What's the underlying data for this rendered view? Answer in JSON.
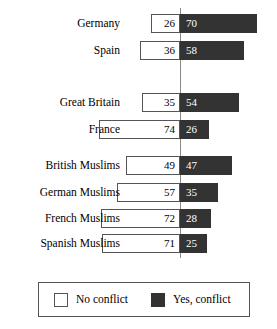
{
  "chart_data": {
    "type": "bar",
    "subtype": "diverging-stacked-bar",
    "title": "",
    "xlabel": "",
    "ylabel": "",
    "categories": [
      "Germany",
      "Spain",
      "Great Britain",
      "France",
      "British Muslims",
      "German Muslims",
      "French Muslims",
      "Spanish Muslims"
    ],
    "series": [
      {
        "name": "No conflict",
        "color": "#ffffff",
        "values": [
          26,
          36,
          35,
          74,
          49,
          57,
          72,
          71
        ]
      },
      {
        "name": "Yes, conflict",
        "color": "#333333",
        "values": [
          70,
          58,
          54,
          26,
          47,
          35,
          28,
          25
        ]
      }
    ],
    "groups": [
      {
        "name": "general-publics-a",
        "categories": [
          "Germany",
          "Spain"
        ]
      },
      {
        "name": "general-publics-b",
        "categories": [
          "Great Britain",
          "France"
        ]
      },
      {
        "name": "muslim-publics",
        "categories": [
          "British Muslims",
          "German Muslims",
          "French Muslims",
          "Spanish Muslims"
        ]
      }
    ],
    "grid": false,
    "legend_position": "bottom",
    "axis_center": 0,
    "units": "percent"
  },
  "rows": [
    {
      "label": "Germany",
      "left": 26,
      "right": 70,
      "top": 14
    },
    {
      "label": "Spain",
      "left": 36,
      "right": 58,
      "top": 41
    },
    {
      "label": "Great Britain",
      "left": 35,
      "right": 54,
      "top": 93
    },
    {
      "label": "France",
      "left": 74,
      "right": 26,
      "top": 120
    },
    {
      "label": "British Muslims",
      "left": 49,
      "right": 47,
      "top": 156
    },
    {
      "label": "German Muslims",
      "left": 57,
      "right": 35,
      "top": 183
    },
    {
      "label": "French Muslims",
      "left": 72,
      "right": 28,
      "top": 209
    },
    {
      "label": "Spanish Muslims",
      "left": 71,
      "right": 25,
      "top": 234
    }
  ],
  "legend": {
    "items": [
      {
        "label": "No conflict",
        "swatch": "empty-square-swatch"
      },
      {
        "label": "Yes, conflict",
        "swatch": "filled-square-swatch"
      }
    ]
  },
  "axis": {
    "center_x": 180,
    "top": 8,
    "bottom": 258,
    "color": "#8a8a8a"
  },
  "scale": {
    "px_per_unit": 1.1
  }
}
